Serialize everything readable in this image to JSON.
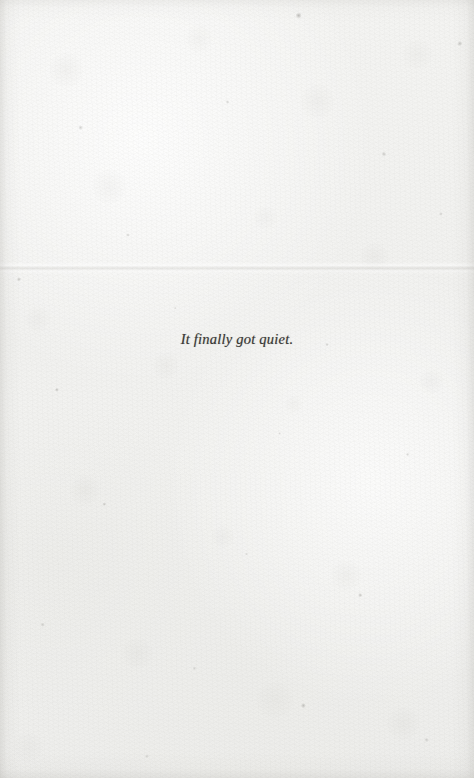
{
  "page": {
    "kind": "scanned-book-page",
    "paper_color": "#f2f2f0",
    "ink_color": "#2b2a28",
    "width": 474,
    "height": 778
  },
  "content": {
    "body_line": "It finally got quiet."
  },
  "header": {
    "running_head": "",
    "page_number": ""
  },
  "footer": {
    "page_number": ""
  }
}
